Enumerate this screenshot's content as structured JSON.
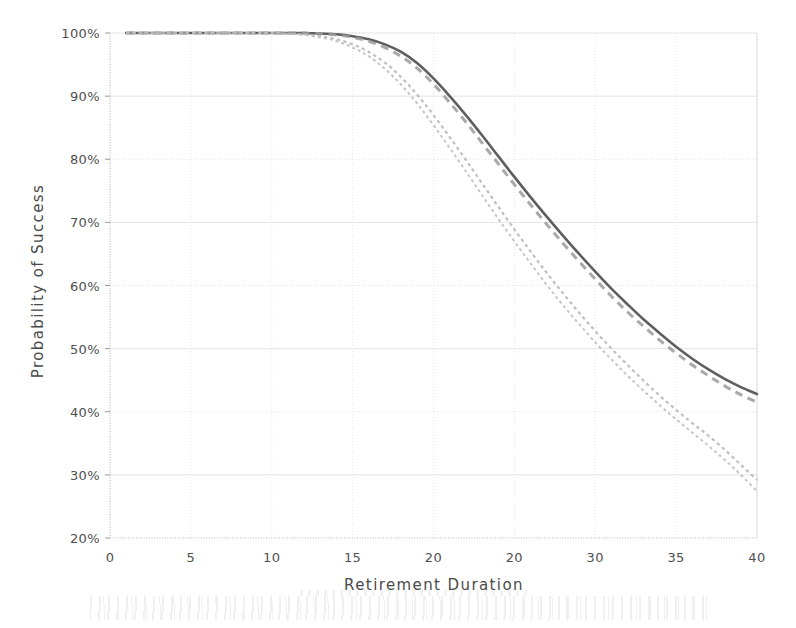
{
  "chart_data": {
    "type": "line",
    "title": "",
    "xlabel": "Retirement Duration",
    "ylabel": "Probability of Success",
    "xlim": [
      0,
      40
    ],
    "ylim": [
      20,
      100
    ],
    "grid": true,
    "legend": "none",
    "y_tick_labels": [
      "100%",
      "90%",
      "80%",
      "70%",
      "60%",
      "50%",
      "40%",
      "30%",
      "20%"
    ],
    "y_ticks": [
      100,
      90,
      80,
      70,
      60,
      50,
      40,
      30,
      20
    ],
    "x_tick_labels": [
      "0",
      "5",
      "10",
      "15",
      "20",
      "20",
      "30",
      "35",
      "40"
    ],
    "x_ticks": [
      0,
      5,
      10,
      15,
      20,
      25,
      30,
      35,
      40
    ],
    "x": [
      1,
      2,
      3,
      4,
      5,
      6,
      7,
      8,
      9,
      10,
      11,
      12,
      13,
      14,
      15,
      16,
      17,
      18,
      19,
      20,
      21,
      22,
      23,
      24,
      25,
      26,
      27,
      28,
      29,
      30,
      31,
      32,
      33,
      34,
      35,
      36,
      37,
      38,
      39,
      40
    ],
    "series": [
      {
        "name": "series-1-solid",
        "style": "solid",
        "color": "#555555",
        "width": 2.6,
        "values": [
          100,
          100,
          100,
          100,
          100,
          100,
          100,
          100,
          100,
          100,
          100,
          100,
          99.9,
          99.8,
          99.5,
          99.0,
          98.2,
          97.0,
          95.2,
          92.8,
          90.0,
          87.0,
          83.8,
          80.5,
          77.2,
          74.0,
          70.9,
          67.9,
          65.0,
          62.2,
          59.5,
          57.0,
          54.6,
          52.4,
          50.3,
          48.4,
          46.7,
          45.2,
          43.9,
          42.8
        ]
      },
      {
        "name": "series-2-dashed",
        "style": "dashed",
        "color": "#9a9a9a",
        "width": 3.0,
        "values": [
          100,
          100,
          100,
          100,
          100,
          100,
          100,
          100,
          100,
          100,
          100,
          100,
          99.9,
          99.7,
          99.3,
          98.7,
          97.7,
          96.3,
          94.4,
          91.9,
          89.0,
          85.9,
          82.6,
          79.3,
          76.0,
          72.8,
          69.7,
          66.7,
          63.8,
          61.0,
          58.3,
          55.8,
          53.5,
          51.3,
          49.3,
          47.4,
          45.7,
          44.1,
          42.7,
          41.5
        ]
      },
      {
        "name": "series-3-dotted-upper",
        "style": "dotted",
        "color": "#b4b4b4",
        "width": 2.2,
        "values": [
          100,
          100,
          100,
          100,
          100,
          100,
          100,
          100,
          100,
          100,
          99.9,
          99.8,
          99.5,
          99.0,
          98.2,
          97.0,
          95.3,
          93.0,
          90.2,
          87.0,
          83.5,
          79.9,
          76.2,
          72.5,
          68.9,
          65.4,
          62.0,
          58.8,
          55.7,
          52.8,
          50.0,
          47.4,
          44.9,
          42.5,
          40.3,
          38.2,
          36.2,
          34.0,
          31.6,
          29.2
        ]
      },
      {
        "name": "series-4-dotted-lower",
        "style": "dotted",
        "color": "#bcbcbc",
        "width": 2.0,
        "values": [
          100,
          100,
          100,
          100,
          100,
          100,
          100,
          100,
          100,
          100,
          99.9,
          99.7,
          99.3,
          98.7,
          97.7,
          96.3,
          94.3,
          91.8,
          88.8,
          85.4,
          81.8,
          78.1,
          74.3,
          70.6,
          67.0,
          63.5,
          60.1,
          56.9,
          53.9,
          51.0,
          48.3,
          45.7,
          43.3,
          41.0,
          38.8,
          36.7,
          34.6,
          32.4,
          30.0,
          27.4
        ]
      }
    ]
  },
  "axes": {
    "y_title": "Probability of Success",
    "x_title": "Retirement Duration"
  },
  "colors": {
    "grid": "#e2e2e2",
    "axis": "#c9c9c9",
    "text": "#4a4a4a",
    "background": "#ffffff"
  }
}
